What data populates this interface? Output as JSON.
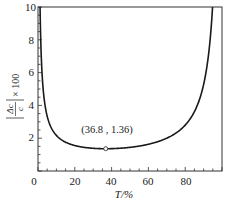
{
  "chart_data": {
    "type": "line",
    "title": "",
    "xlabel": "T/%",
    "ylabel": "|Δc/c| × 100",
    "ylabel_parts": {
      "frac_num": "Δc",
      "frac_den": "c",
      "suffix": "× 100"
    },
    "xlim": [
      0,
      100
    ],
    "ylim": [
      0,
      10
    ],
    "x_ticks": [
      0,
      20,
      40,
      60,
      80
    ],
    "y_ticks": [
      0,
      2,
      4,
      6,
      8,
      10
    ],
    "grid": false,
    "legend": null,
    "series": [
      {
        "name": "relative concentration error",
        "x": [
          1.2,
          1.5,
          2,
          3,
          5,
          10,
          20,
          30,
          36.8,
          50,
          60,
          70,
          80,
          85,
          90,
          93,
          95
        ],
        "y": [
          9.41,
          7.93,
          6.38,
          4.75,
          3.34,
          2.17,
          1.55,
          1.38,
          1.36,
          1.44,
          1.63,
          2.0,
          2.8,
          3.62,
          5.27,
          7.4,
          10.2
        ]
      }
    ],
    "annotations": [
      {
        "text": "(36.8, 1.36)",
        "x": 36.8,
        "y": 1.36,
        "marker": "open-circle"
      }
    ]
  },
  "labels": {
    "annotation": "(36.8 , 1.36)",
    "xlabel": "T/%",
    "ylabel_num": "Δc",
    "ylabel_den": "c",
    "ylabel_suffix": "× 100",
    "xticks": [
      "0",
      "20",
      "40",
      "60",
      "80"
    ],
    "yticks": [
      "2",
      "4",
      "6",
      "8",
      "10"
    ]
  }
}
